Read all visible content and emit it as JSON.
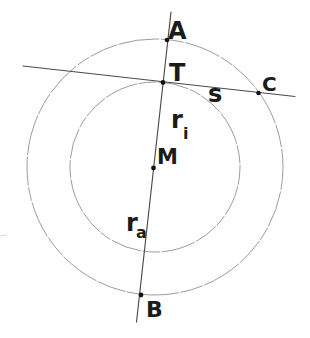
{
  "figure": {
    "width": 310,
    "height": 338,
    "background": "#ffffff",
    "colors": {
      "circle_stroke": "#9c9c9c",
      "line_stroke": "#4a4a4a",
      "dot_fill": "#141414",
      "label_color": "#1b1b1b",
      "artifact_color": "#dcdcdc"
    },
    "circles": [
      {
        "name": "outer-circle",
        "cx": 155,
        "cy": 167,
        "r": 128,
        "stroke_width": 1,
        "dash": "23 1.6 37 1.8 14 1.5 29 1.7 41 1.6"
      },
      {
        "name": "inner-circle",
        "cx": 155,
        "cy": 167,
        "r": 85,
        "stroke_width": 1,
        "dash": "18 1.5 31 1.8 12 1.4 25 1.6 34 1.5"
      }
    ],
    "lines": [
      {
        "name": "secant-line-AB",
        "x1": 171,
        "y1": 12,
        "x2": 136.5,
        "y2": 322,
        "stroke_width": 1.15
      },
      {
        "name": "tangent-line-TC",
        "x1": 23,
        "y1": 66,
        "x2": 295,
        "y2": 96.5,
        "stroke_width": 1.1
      },
      {
        "name": "scan-artifact",
        "x1": 0,
        "y1": 236,
        "x2": 7,
        "y2": 235,
        "stroke_width": 1,
        "color": "#dcdcdc"
      }
    ],
    "points": [
      {
        "name": "point-A",
        "x": 167,
        "y": 40,
        "r": 2.3
      },
      {
        "name": "point-T",
        "x": 163,
        "y": 82.5,
        "r": 2.4
      },
      {
        "name": "point-C",
        "x": 258.5,
        "y": 93,
        "r": 2.3
      },
      {
        "name": "point-M",
        "x": 153.5,
        "y": 168,
        "r": 2.4
      },
      {
        "name": "point-B",
        "x": 141,
        "y": 295,
        "r": 2.4
      }
    ],
    "labels": [
      {
        "name": "label-A",
        "text": "A",
        "x": 168,
        "y": 39,
        "size": 24
      },
      {
        "name": "label-T",
        "text": "T",
        "x": 169,
        "y": 81,
        "size": 24
      },
      {
        "name": "label-C",
        "text": "C",
        "x": 262,
        "y": 91,
        "size": 20
      },
      {
        "name": "label-s",
        "text": "s",
        "x": 208,
        "y": 102,
        "size": 24
      },
      {
        "name": "label-ri",
        "text": "r",
        "sub": "i",
        "x": 171,
        "y": 128,
        "size": 24,
        "sub_x": 183,
        "sub_y": 139,
        "sub_size": 16
      },
      {
        "name": "label-M",
        "text": "M",
        "x": 157,
        "y": 164,
        "size": 21
      },
      {
        "name": "label-ra",
        "text": "r",
        "sub": "a",
        "x": 126,
        "y": 231,
        "size": 24,
        "sub_x": 136,
        "sub_y": 238,
        "sub_size": 16
      },
      {
        "name": "label-B",
        "text": "B",
        "x": 146,
        "y": 317,
        "size": 22
      }
    ]
  }
}
